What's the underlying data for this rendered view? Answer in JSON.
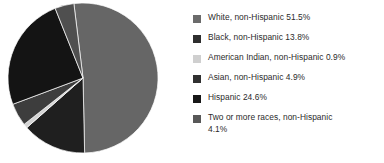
{
  "chart_data": {
    "type": "pie",
    "title": "",
    "subtitle": "",
    "xlabel": "",
    "ylabel": "",
    "grid": false,
    "legend_position": "right",
    "start_angle_deg": -7,
    "direction": "clockwise",
    "categories": [
      "White, non-Hispanic",
      "Black, non-Hispanic",
      "American Indian, non-Hispanic",
      "Asian, non-Hispanic",
      "Hispanic",
      "Two or more races, non-Hispanic"
    ],
    "values": [
      51.5,
      13.8,
      0.9,
      4.9,
      24.6,
      4.1
    ],
    "value_unit": "%",
    "colors": [
      "#666666",
      "#1f1f1f",
      "#d4d4d4",
      "#3d3d3d",
      "#141414",
      "#4f4f4f"
    ],
    "slices": [
      {
        "label": "White, non-Hispanic",
        "value": 51.5,
        "color": "#666666"
      },
      {
        "label": "Black, non-Hispanic",
        "value": 13.8,
        "color": "#1f1f1f"
      },
      {
        "label": "American Indian, non-Hispanic",
        "value": 0.9,
        "color": "#d4d4d4"
      },
      {
        "label": "Asian, non-Hispanic",
        "value": 4.9,
        "color": "#3d3d3d"
      },
      {
        "label": "Hispanic",
        "value": 24.6,
        "color": "#141414"
      },
      {
        "label": "Two or more races, non-Hispanic",
        "value": 4.1,
        "color": "#4f4f4f"
      }
    ]
  },
  "legend": {
    "items": [
      {
        "swatch_color": "#6b6b6b",
        "label": "White, non-Hispanic 51.5%"
      },
      {
        "swatch_color": "#2e2e2e",
        "label": "Black, non-Hispanic 13.8%"
      },
      {
        "swatch_color": "#cfcfcf",
        "label": "American Indian, non-Hispanic 0.9%"
      },
      {
        "swatch_color": "#303030",
        "label": "Asian, non-Hispanic 4.9%"
      },
      {
        "swatch_color": "#171717",
        "label": "Hispanic 24.6%"
      },
      {
        "swatch_color": "#585858",
        "label": "Two or more races, non-Hispanic\n4.1%"
      }
    ]
  }
}
